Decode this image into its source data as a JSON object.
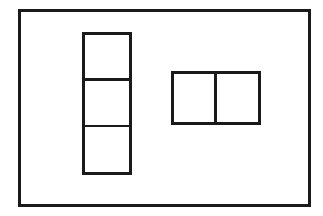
{
  "diagram": {
    "type": "floor-plan-layout",
    "stroke_color": "#1a1a1a",
    "background_color": "#ffffff",
    "outer_frame": {
      "x": 18,
      "y": 9,
      "width": 293,
      "height": 198,
      "stroke": 3
    },
    "vertical_stack": {
      "x": 82,
      "y": 32,
      "width": 50,
      "height": 143,
      "stroke": 3,
      "cells": 3,
      "dividers_y": [
        {
          "y": 78,
          "thickness": 3
        },
        {
          "y": 125,
          "thickness": 2
        }
      ]
    },
    "horizontal_pair": {
      "x": 171,
      "y": 71,
      "width": 90,
      "height": 54,
      "stroke": 3,
      "cells": 2,
      "dividers_x": [
        {
          "x": 214,
          "thickness": 3
        }
      ]
    }
  }
}
